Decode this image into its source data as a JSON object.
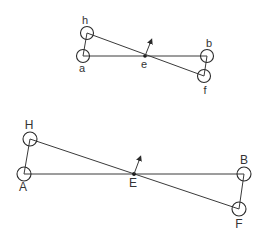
{
  "figures": [
    {
      "name": "small-linkage",
      "labels": {
        "a": "a",
        "h": "h",
        "e": "e",
        "b": "b",
        "f": "f"
      }
    },
    {
      "name": "large-linkage",
      "labels": {
        "a": "A",
        "h": "H",
        "e": "E",
        "b": "B",
        "f": "F"
      }
    }
  ],
  "colors": {
    "line": "#3a3a3a",
    "background": "#ffffff"
  }
}
